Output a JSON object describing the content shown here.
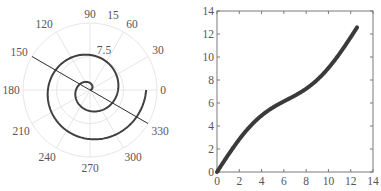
{
  "chart_data": [
    {
      "type": "line",
      "subtype": "polar",
      "title": "",
      "theta_tick_labels": [
        "0",
        "30",
        "60",
        "90",
        "120",
        "150",
        "180",
        "210",
        "240",
        "270",
        "300",
        "330"
      ],
      "r_tick_labels": [
        "7.5",
        "15"
      ],
      "rlim": [
        0,
        15
      ],
      "grid": true,
      "series": [
        {
          "name": "spiral",
          "equation": "r = theta",
          "theta_range_rad": [
            0,
            12.566
          ],
          "color": "#404040"
        },
        {
          "name": "line",
          "theta_deg": [
            150,
            330
          ],
          "r": [
            15,
            15
          ],
          "color": "#333333"
        }
      ]
    },
    {
      "type": "line",
      "title": "",
      "xlabel": "",
      "ylabel": "",
      "xlim": [
        0,
        14
      ],
      "ylim": [
        0,
        14
      ],
      "x_tick_labels": [
        "0",
        "2",
        "4",
        "6",
        "8",
        "10",
        "12",
        "14"
      ],
      "y_tick_labels": [
        "0",
        "2",
        "4",
        "6",
        "8",
        "10",
        "12",
        "14"
      ],
      "grid": false,
      "series": [
        {
          "name": "curve",
          "color": "#3a3a3a",
          "x": [
            0,
            1,
            2,
            3,
            4,
            5,
            6,
            7,
            8,
            9,
            10,
            11,
            12,
            12.57
          ],
          "y": [
            0,
            1.48,
            2.84,
            4.0,
            4.91,
            5.6,
            6.14,
            6.65,
            7.24,
            8.02,
            9.04,
            10.29,
            11.72,
            12.57
          ]
        }
      ]
    }
  ],
  "polar": {
    "angle_labels": [
      {
        "text": "0",
        "x": 163,
        "y": 94
      },
      {
        "text": "30",
        "x": 158,
        "y": 54
      },
      {
        "text": "60",
        "x": 132,
        "y": 28
      },
      {
        "text": "90",
        "x": 90,
        "y": 18
      },
      {
        "text": "120",
        "x": 44,
        "y": 28
      },
      {
        "text": "150",
        "x": 19,
        "y": 56
      },
      {
        "text": "180",
        "x": 11,
        "y": 94
      },
      {
        "text": "210",
        "x": 21,
        "y": 135
      },
      {
        "text": "240",
        "x": 47,
        "y": 161
      },
      {
        "text": "270",
        "x": 90,
        "y": 172
      },
      {
        "text": "300",
        "x": 133,
        "y": 161
      },
      {
        "text": "330",
        "x": 160,
        "y": 135
      }
    ],
    "r_labels": [
      {
        "text": "15",
        "x": 113,
        "y": 19
      },
      {
        "text": "7.5",
        "x": 104,
        "y": 54
      }
    ]
  }
}
